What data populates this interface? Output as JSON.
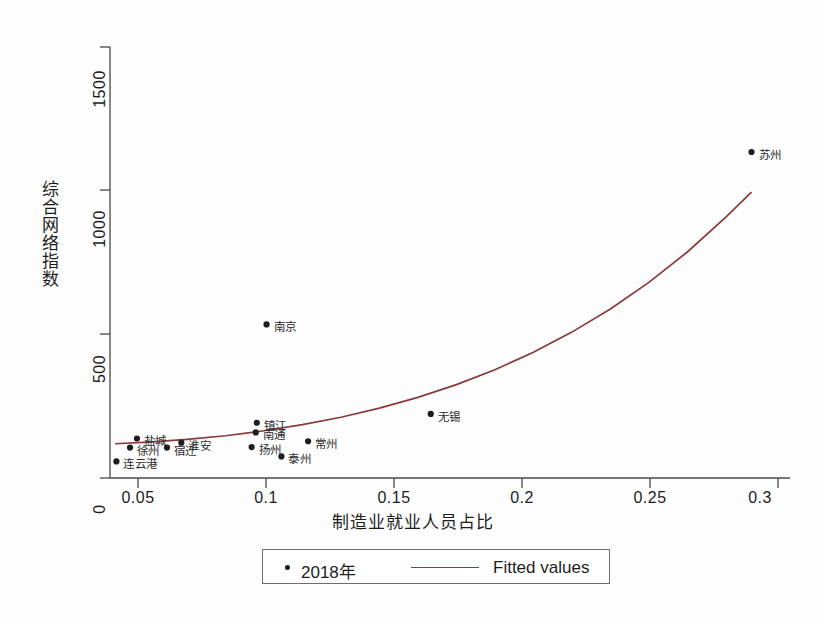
{
  "chart_data": {
    "type": "scatter",
    "title": "",
    "xlabel": "制造业就业人员占比",
    "ylabel": "综合网络指数",
    "xlim": [
      0.04,
      0.305
    ],
    "ylim": [
      0,
      1560
    ],
    "grid": false,
    "legend_position": "bottom",
    "xticks": [
      "0.05",
      "0.1",
      "0.15",
      "0.2",
      "0.25",
      "0.3"
    ],
    "xtick_values": [
      0.05,
      0.1,
      0.15,
      0.2,
      0.25,
      0.3
    ],
    "yticks": [
      "0",
      "500",
      "1000",
      "1500"
    ],
    "ytick_values": [
      0,
      500,
      1000,
      1500
    ],
    "series": [
      {
        "name": "2018年",
        "type": "scatter",
        "marker": "circle",
        "color": "#1d1d1d",
        "points": [
          {
            "label": "连云港",
            "x": 0.0425,
            "y": 60,
            "label_dx": 7,
            "label_dy": -6
          },
          {
            "label": "徐州",
            "x": 0.0478,
            "y": 110,
            "label_dx": 7,
            "label_dy": -6
          },
          {
            "label": "盐城",
            "x": 0.0505,
            "y": 143,
            "label_dx": 7,
            "label_dy": -6
          },
          {
            "label": "宿迁",
            "x": 0.0622,
            "y": 110,
            "label_dx": 7,
            "label_dy": -6
          },
          {
            "label": "淮安",
            "x": 0.0678,
            "y": 128,
            "label_dx": 7,
            "label_dy": -6
          },
          {
            "label": "扬州",
            "x": 0.0952,
            "y": 112,
            "label_dx": 7,
            "label_dy": -6
          },
          {
            "label": "南通",
            "x": 0.0968,
            "y": 165,
            "label_dx": 7,
            "label_dy": -6
          },
          {
            "label": "镇江",
            "x": 0.0972,
            "y": 200,
            "label_dx": 7,
            "label_dy": -6
          },
          {
            "label": "南京",
            "x": 0.101,
            "y": 556,
            "label_dx": 7,
            "label_dy": -6
          },
          {
            "label": "泰州",
            "x": 0.1068,
            "y": 78,
            "label_dx": 7,
            "label_dy": -6
          },
          {
            "label": "常州",
            "x": 0.1172,
            "y": 133,
            "label_dx": 7,
            "label_dy": -6
          },
          {
            "label": "无锡",
            "x": 0.165,
            "y": 232,
            "label_dx": 7,
            "label_dy": -6
          },
          {
            "label": "苏州",
            "x": 0.29,
            "y": 1180,
            "label_dx": 7,
            "label_dy": -6
          }
        ]
      },
      {
        "name": "Fitted values",
        "type": "line",
        "color": "#8a3a3a",
        "x": [
          0.042,
          0.055,
          0.07,
          0.085,
          0.1,
          0.115,
          0.13,
          0.145,
          0.16,
          0.175,
          0.19,
          0.205,
          0.22,
          0.235,
          0.25,
          0.265,
          0.28,
          0.29
        ],
        "y": [
          124,
          130,
          140,
          153,
          171,
          193,
          220,
          253,
          292,
          338,
          392,
          455,
          528,
          612,
          708,
          818,
          944,
          1035
        ]
      }
    ],
    "legend": [
      {
        "name": "2018年",
        "marker": "circle",
        "color": "#1d1d1d"
      },
      {
        "name": "Fitted values",
        "marker": "line",
        "color": "#8a3a3a"
      }
    ]
  },
  "axes": {
    "y_title": "综合网络指数",
    "x_title": "制造业就业人员占比",
    "y_tick_labels": [
      "0",
      "500",
      "1000",
      "1500"
    ],
    "x_tick_labels": [
      "0.05",
      "0.1",
      "0.15",
      "0.2",
      "0.25",
      "0.3"
    ]
  },
  "legend": {
    "scatter_label": "2018年",
    "line_label": "Fitted values"
  },
  "colors": {
    "line": "#8a3a3a",
    "marker": "#1d1d1d",
    "axis": "#4a4a4a",
    "background": "#fdfdfd"
  }
}
